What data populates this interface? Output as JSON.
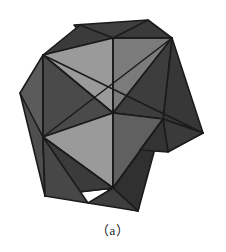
{
  "figure": {
    "caption": "（a）",
    "caption_plain": "(a)",
    "background_color": "#ffffff",
    "edge_color": "#1b1b1b",
    "title": "",
    "object_name": "stellated-polyhedron",
    "palette": {
      "light": "#9a9a9a",
      "light_alt": "#8e8e8e",
      "medium": "#6e6e6e",
      "medium_alt": "#636363",
      "dark": "#3b3b3b",
      "dark_alt": "#333333",
      "darkest": "#2b2b2b",
      "edge": "#1b1b1b"
    },
    "view": {
      "width": 226,
      "height": 226,
      "center_x": 113,
      "center_y": 113
    },
    "spikes": [
      {
        "name": "top-spike",
        "tip_x": 80,
        "tip_y": 25
      },
      {
        "name": "right-spike",
        "tip_x": 203,
        "tip_y": 133
      },
      {
        "name": "left-spike",
        "tip_x": 20,
        "tip_y": 93
      },
      {
        "name": "bottom-spike",
        "tip_x": 138,
        "tip_y": 211
      },
      {
        "name": "upper-right-spike",
        "tip_x": 172,
        "tip_y": 38
      },
      {
        "name": "lower-left-spike",
        "tip_x": 45,
        "tip_y": 196
      }
    ],
    "faces": [
      {
        "id": "f01",
        "points": "43,55 113,38 113,113",
        "fill": "#9a9a9a"
      },
      {
        "id": "f02",
        "points": "113,38 172,38 113,113",
        "fill": "#7d7d7d"
      },
      {
        "id": "f03",
        "points": "80,25 113,38 43,55",
        "fill": "#3b3b3b"
      },
      {
        "id": "f04",
        "points": "113,38 172,38 148,20",
        "fill": "#3b3b3b"
      },
      {
        "id": "f05",
        "points": "43,55 113,113 43,137",
        "fill": "#4a4a4a"
      },
      {
        "id": "f06",
        "points": "43,55 43,137 20,93",
        "fill": "#555555"
      },
      {
        "id": "f07",
        "points": "113,113 172,38 163,119",
        "fill": "#3c3c3c"
      },
      {
        "id": "f08",
        "points": "172,38 203,133 163,119",
        "fill": "#3a3a3a"
      },
      {
        "id": "f09",
        "points": "113,113 163,119 203,133",
        "fill": "#9a9a9a"
      },
      {
        "id": "f10",
        "points": "43,137 113,113 113,188",
        "fill": "#9a9a9a"
      },
      {
        "id": "f11",
        "points": "113,113 163,119 113,188",
        "fill": "#5f5f5f"
      },
      {
        "id": "f12",
        "points": "43,137 113,188 45,196",
        "fill": "#3b3b3b"
      },
      {
        "id": "f13",
        "points": "113,188 163,119 138,211",
        "fill": "#323232"
      },
      {
        "id": "f14",
        "points": "113,188 138,211 85,205",
        "fill": "#3f3f3f"
      },
      {
        "id": "f15",
        "points": "43,137 45,196 85,205",
        "fill": "#444444"
      }
    ]
  }
}
